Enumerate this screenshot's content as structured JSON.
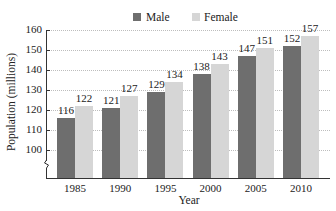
{
  "chart_data": {
    "type": "bar",
    "title": "",
    "xlabel": "Year",
    "ylabel": "Population (millions)",
    "categories": [
      "1985",
      "1990",
      "1995",
      "2000",
      "2005",
      "2010"
    ],
    "series": [
      {
        "name": "Male",
        "color": "#6e6e6e",
        "values": [
          116,
          121,
          129,
          138,
          147,
          152
        ]
      },
      {
        "name": "Female",
        "color": "#d6d6d6",
        "values": [
          122,
          127,
          134,
          143,
          151,
          157
        ]
      }
    ],
    "yticks": [
      100,
      110,
      120,
      130,
      140,
      150,
      160
    ],
    "ylim": [
      90,
      160
    ],
    "y_axis_break": true,
    "grid": true,
    "legend_position": "top"
  },
  "legend": {
    "male": "Male",
    "female": "Female"
  },
  "axes": {
    "x_title": "Year",
    "y_title": "Population (millions)"
  }
}
